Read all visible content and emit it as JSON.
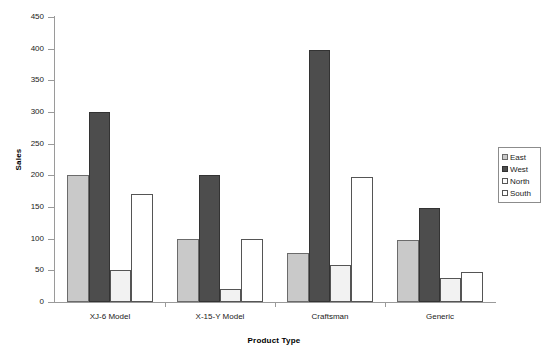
{
  "chart_data": {
    "type": "bar",
    "title": "",
    "xlabel": "Product Type",
    "ylabel": "Sales",
    "categories": [
      "XJ-6 Model",
      "X-15-Y Model",
      "Craftsman",
      "Generic"
    ],
    "series": [
      {
        "name": "East",
        "color": "#c9c9c9",
        "values": [
          200,
          100,
          78,
          98
        ]
      },
      {
        "name": "West",
        "color": "#4d4d4d",
        "values": [
          300,
          200,
          398,
          148
        ]
      },
      {
        "name": "North",
        "color": "#f2f2f2",
        "values": [
          50,
          20,
          58,
          38
        ]
      },
      {
        "name": "South",
        "color": "#ffffff",
        "values": [
          170,
          100,
          198,
          48
        ]
      }
    ],
    "ylim": [
      0,
      450
    ],
    "yticks": [
      0,
      50,
      100,
      150,
      200,
      250,
      300,
      350,
      400,
      450
    ],
    "ytick_labels": [
      "0",
      "50",
      "100",
      "150",
      "200",
      "250",
      "300",
      "350",
      "400",
      "450"
    ],
    "grid": false,
    "legend_position": "right",
    "legend_entries": [
      "East",
      "West",
      "North",
      "South"
    ],
    "background_color": "#ffffff",
    "axis_color": "#9a9a9a"
  }
}
